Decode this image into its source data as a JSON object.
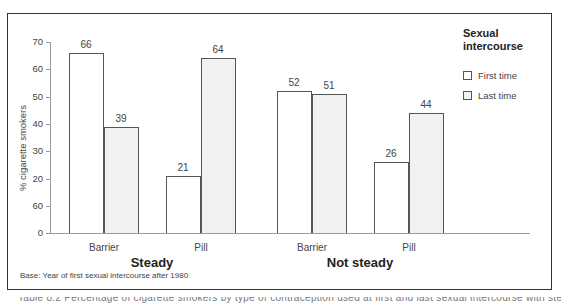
{
  "chart_data": {
    "type": "bar",
    "title": "",
    "xlabel": "",
    "ylabel": "% cigarette smokers",
    "ylim": [
      0,
      70
    ],
    "y_ticks": [
      {
        "value": 0,
        "label": "0"
      },
      {
        "value": 10,
        "label": "60"
      },
      {
        "value": 20,
        "label": "20"
      },
      {
        "value": 30,
        "label": "30"
      },
      {
        "value": 40,
        "label": "40"
      },
      {
        "value": 50,
        "label": "50"
      },
      {
        "value": 60,
        "label": "60"
      },
      {
        "value": 70,
        "label": "70"
      }
    ],
    "grid": false,
    "legend_position": "right",
    "legend_title": "Sexual intercourse",
    "groups": [
      {
        "name": "Steady",
        "categories": [
          "Barrier",
          "Pill"
        ]
      },
      {
        "name": "Not steady",
        "categories": [
          "Barrier",
          "Pill"
        ]
      }
    ],
    "categories": [
      "Steady – Barrier",
      "Steady – Pill",
      "Not steady – Barrier",
      "Not steady – Pill"
    ],
    "series": [
      {
        "name": "First time",
        "color": "#ffffff",
        "values": [
          66,
          21,
          52,
          26
        ]
      },
      {
        "name": "Last time",
        "color": "#f1f1f1",
        "values": [
          39,
          64,
          51,
          44
        ]
      }
    ],
    "footnote": "Base: Year of first sexual intercourse after 1980"
  },
  "axis": {
    "ylabel": "% cigarette smokers",
    "ticks": [
      "0",
      "60",
      "20",
      "30",
      "40",
      "50",
      "60",
      "70"
    ]
  },
  "bars": [
    {
      "value": "66",
      "height": 66,
      "left": 69,
      "type": "first"
    },
    {
      "value": "39",
      "height": 39,
      "left": 104,
      "type": "last"
    },
    {
      "value": "21",
      "height": 21,
      "left": 166,
      "type": "first"
    },
    {
      "value": "64",
      "height": 64,
      "left": 201,
      "type": "last"
    },
    {
      "value": "52",
      "height": 52,
      "left": 277,
      "type": "first"
    },
    {
      "value": "51",
      "height": 51,
      "left": 312,
      "type": "last"
    },
    {
      "value": "26",
      "height": 26,
      "left": 374,
      "type": "first"
    },
    {
      "value": "44",
      "height": 44,
      "left": 409,
      "type": "last"
    }
  ],
  "categories": [
    "Barrier",
    "Pill",
    "Barrier",
    "Pill"
  ],
  "groups": [
    "Steady",
    "Not steady"
  ],
  "legend": {
    "title_line1": "Sexual",
    "title_line2": "intercourse",
    "items": [
      "First time",
      "Last time"
    ]
  },
  "footnote": "Base: Year of first sexual intercourse after 1980",
  "cutoff_text": "Table 8.2 Percentage of cigarette smokers by type of contraception used at first and last sexual intercourse with steady and not steady partners"
}
